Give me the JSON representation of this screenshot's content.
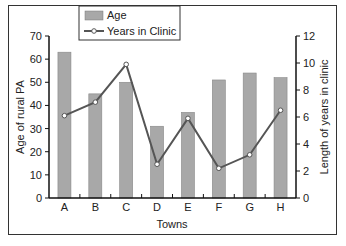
{
  "chart_data": {
    "type": "bar+line",
    "title": "",
    "xlabel": "Towns",
    "ylabel": "Age of rural PA",
    "y2label": "Length of years in clinic",
    "categories": [
      "A",
      "B",
      "C",
      "D",
      "E",
      "F",
      "G",
      "H"
    ],
    "series": [
      {
        "name": "Age",
        "type": "bar",
        "axis": "left",
        "values": [
          63,
          45,
          50,
          31,
          37,
          51,
          54,
          52
        ],
        "color": "#a8a8a8"
      },
      {
        "name": "Years in Clinic",
        "type": "line",
        "axis": "right",
        "values": [
          6.1,
          7.1,
          9.9,
          2.5,
          5.9,
          2.2,
          3.2,
          6.5
        ],
        "color": "#555555"
      }
    ],
    "ylim": [
      0,
      70
    ],
    "y2lim": [
      0,
      12
    ],
    "yticks": [
      0,
      10,
      20,
      30,
      40,
      50,
      60,
      70
    ],
    "y2ticks": [
      0,
      2,
      4,
      6,
      8,
      10,
      12
    ],
    "legend": {
      "position": "top-left-inside",
      "entries": [
        "Age",
        "Years in Clinic"
      ]
    },
    "grid": false
  },
  "labels": {
    "xlabel": "Towns",
    "ylabel": "Age of rural PA",
    "y2label": "Length of years in clinic",
    "legend_age": "Age",
    "legend_years": "Years in Clinic"
  }
}
